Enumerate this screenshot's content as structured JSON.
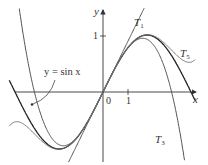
{
  "diagram": {
    "origin_px": [
      103,
      92
    ],
    "unit_px": [
      28,
      57
    ],
    "x_range": [
      -3.35,
      3.3
    ],
    "axes": {
      "x_label": "x",
      "y_label": "y",
      "origin_label": "0",
      "x_tick_label": "1",
      "y_tick_label": "1"
    },
    "curves": [
      {
        "name": "sin-x-curve",
        "label": "y = sin x",
        "coeffs": "sin",
        "color": "#222222",
        "width": 1.3
      },
      {
        "name": "t1-curve",
        "label": "T",
        "sub": "1",
        "coeffs": [
          0,
          1
        ],
        "color": "#555555",
        "width": 1.0
      },
      {
        "name": "t3-curve",
        "label": "T",
        "sub": "3",
        "coeffs": [
          0,
          1,
          0,
          -0.1666667
        ],
        "color": "#555555",
        "width": 1.0
      },
      {
        "name": "t5-curve",
        "label": "T",
        "sub": "5",
        "coeffs": [
          0,
          1,
          0,
          -0.1666667,
          0,
          0.0083333
        ],
        "color": "#777777",
        "width": 1.0
      }
    ],
    "labels": {
      "sin": "y = sin x",
      "t1_main": "T",
      "t1_sub": "1",
      "t3_main": "T",
      "t3_sub": "3",
      "t5_main": "T",
      "t5_sub": "5"
    }
  }
}
